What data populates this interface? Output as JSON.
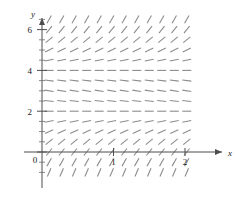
{
  "figure": {
    "kind": "slope-field",
    "background_color": "#ffffff"
  },
  "axes": {
    "x_axis": {
      "label": "x",
      "label_color": "#1a1a1a",
      "arrow": true,
      "tick_values": [
        0,
        1,
        2
      ],
      "tick_labels": [
        "0",
        "1",
        "2"
      ],
      "axis_color": "#4d4d4d",
      "range": [
        -0.25,
        2.45
      ]
    },
    "y_axis": {
      "label": "y",
      "label_color": "#1a1a1a",
      "arrow": true,
      "tick_values": [
        0,
        2,
        4,
        6
      ],
      "tick_labels": [
        "0",
        "2",
        "4",
        "6"
      ],
      "minor_ticks": true,
      "axis_color": "#4d4d4d",
      "range": [
        -1.1,
        6.9
      ]
    },
    "origin_label": "0"
  },
  "chart_data": {
    "type": "scatter",
    "title": "",
    "xlabel": "x",
    "ylabel": "y",
    "xlim": [
      -0.25,
      2.45
    ],
    "ylim": [
      -1.1,
      6.9
    ],
    "grid": false,
    "legend": false,
    "equilibria": [
      2,
      4
    ],
    "field_color": "#8c8c8c",
    "field_x_start": 0.1,
    "field_x_step": 0.175,
    "field_x_count": 12,
    "field_y_start": -1.0,
    "field_y_step": 0.5,
    "field_y_count": 16,
    "slope_rule": "dy/dx = k*(y-2)*(y-4), k = 0.55",
    "slope_k": 0.55,
    "tick_length": 9
  },
  "layout": {
    "origin_px": {
      "x": 42,
      "y": 152
    },
    "x_unit_px": 71.5,
    "y_unit_px": 20.4
  }
}
